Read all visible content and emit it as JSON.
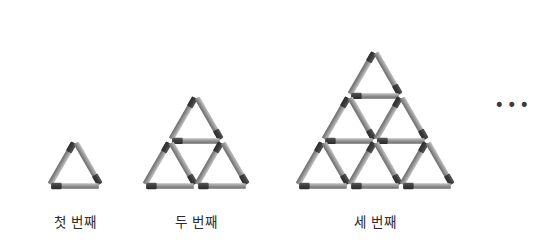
{
  "page": {
    "background_color": "#ffffff",
    "width": 548,
    "height": 249
  },
  "match": {
    "body_color_light": "#b0b0b0",
    "body_color_mid": "#8f8f8f",
    "body_color_dark": "#6f6f6f",
    "head_color": "#3f3f3f",
    "thickness": 5.6,
    "head_fraction": 0.22,
    "gap": 2.2
  },
  "figures": [
    {
      "id": "figure-1",
      "caption": "첫 번째",
      "rows": 1,
      "match_count": 3,
      "triangle_count": 1,
      "apex_x": 75,
      "base_y": 186,
      "side": 52,
      "caption_x": 75,
      "caption_y": 211
    },
    {
      "id": "figure-2",
      "caption": "두 번째",
      "rows": 2,
      "match_count": 9,
      "triangle_count": 3,
      "apex_x": 196,
      "base_y": 186,
      "side": 52,
      "caption_x": 196,
      "caption_y": 211
    },
    {
      "id": "figure-3",
      "caption": "세 번째",
      "rows": 3,
      "match_count": 18,
      "triangle_count": 6,
      "apex_x": 375,
      "base_y": 186,
      "side": 52,
      "caption_x": 375,
      "caption_y": 211
    }
  ],
  "ellipsis": {
    "text": "•••",
    "x": 513,
    "y": 105
  },
  "chart_data": {
    "type": "table",
    "categories": [
      "첫 번째",
      "두 번째",
      "세 번째"
    ],
    "series": [
      {
        "name": "성냥개비 수",
        "values": [
          3,
          9,
          18
        ]
      },
      {
        "name": "작은 삼각형 수",
        "values": [
          1,
          3,
          6
        ]
      },
      {
        "name": "단 수",
        "values": [
          1,
          2,
          3
        ]
      }
    ],
    "xlabel": "단계",
    "ylabel": "개수",
    "annotations": [
      "•••"
    ]
  }
}
